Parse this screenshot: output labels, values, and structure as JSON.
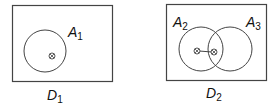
{
  "panels": [
    {
      "name": "D",
      "subscript": "1",
      "sets": [
        {
          "name": "A",
          "subscript": "1"
        }
      ]
    },
    {
      "name": "D",
      "subscript": "2",
      "sets": [
        {
          "name": "A",
          "subscript": "2"
        },
        {
          "name": "A",
          "subscript": "3"
        }
      ]
    }
  ],
  "colors": {
    "stroke": "#333333",
    "background": "#ffffff"
  }
}
